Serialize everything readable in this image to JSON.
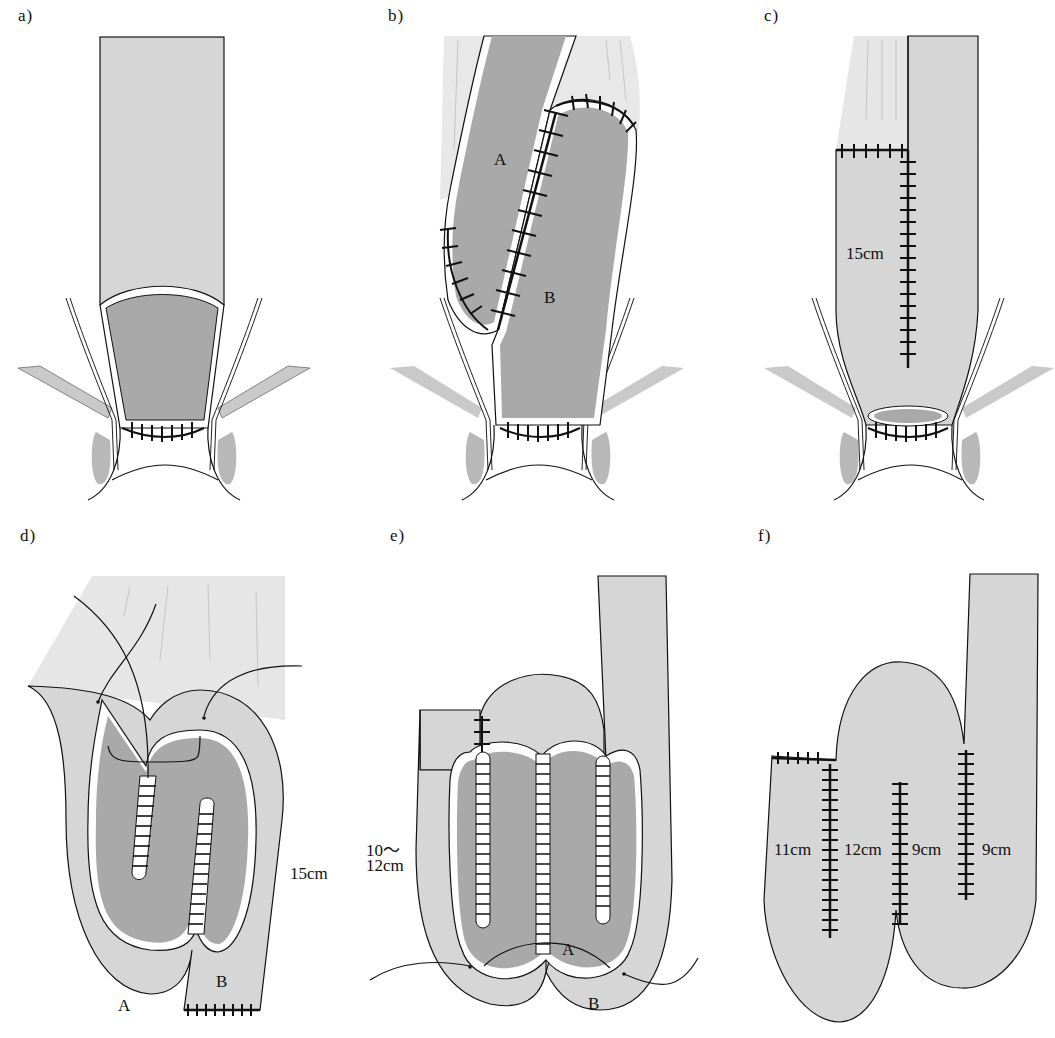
{
  "figure": {
    "colors": {
      "outer_bowel": "#d6d6d6",
      "inner_lumen": "#a9a9a9",
      "mesentery": "#e4e4e4",
      "outline": "#111111",
      "staple": "#111111",
      "background": "#ffffff"
    },
    "panels": [
      {
        "id": "a",
        "label": "a)",
        "annotations": []
      },
      {
        "id": "b",
        "label": "b)",
        "annotations": [
          "A",
          "B"
        ]
      },
      {
        "id": "c",
        "label": "c)",
        "annotations": [
          "15cm"
        ]
      },
      {
        "id": "d",
        "label": "d)",
        "annotations": [
          "15cm",
          "A",
          "B"
        ]
      },
      {
        "id": "e",
        "label": "e)",
        "annotations": [
          "10～",
          "12cm",
          "A",
          "B"
        ]
      },
      {
        "id": "f",
        "label": "f)",
        "annotations": [
          "11cm",
          "12cm",
          "9cm",
          "9cm"
        ]
      }
    ]
  }
}
